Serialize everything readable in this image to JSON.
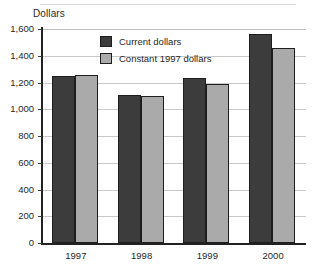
{
  "chart_data": {
    "type": "bar",
    "title": "",
    "ylabel": "Dollars",
    "xlabel": "",
    "categories": [
      "1997",
      "1998",
      "1999",
      "2000"
    ],
    "series": [
      {
        "name": "Current dollars",
        "color": "#3c3c3c",
        "values": [
          1250,
          1110,
          1235,
          1565
        ]
      },
      {
        "name": "Constant 1997 dollars",
        "color": "#aaaaaa",
        "values": [
          1255,
          1100,
          1190,
          1460
        ]
      }
    ],
    "ylim": [
      0,
      1600
    ],
    "ytick_step": 200,
    "ytick_labels": [
      "0",
      "200",
      "400",
      "600",
      "800",
      "1,000",
      "1,200",
      "1,400",
      "1,600"
    ],
    "ytick_values": [
      0,
      200,
      400,
      600,
      800,
      1000,
      1200,
      1400,
      1600
    ],
    "grid": true,
    "grid_axis": "y",
    "legend_position": "inside-top-center"
  },
  "legend": {
    "entries": [
      {
        "label": "Current dollars",
        "swatch": "current"
      },
      {
        "label": "Constant 1997 dollars",
        "swatch": "constant"
      }
    ]
  }
}
